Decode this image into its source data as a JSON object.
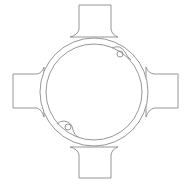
{
  "diagram": {
    "view": "top",
    "colors": {
      "background": "#ffffff",
      "stroke": "#8a8a8a"
    },
    "center": [
      94,
      92
    ],
    "outer_ring_radius": 54,
    "inner_ring_radius": 48,
    "arms": [
      {
        "name": "top",
        "x": 79,
        "y": 5,
        "w": 32,
        "h": 30
      },
      {
        "name": "bottom",
        "x": 79,
        "y": 149,
        "w": 32,
        "h": 29
      },
      {
        "name": "left",
        "x": 13,
        "y": 74,
        "w": 30,
        "h": 34
      },
      {
        "name": "right",
        "x": 150,
        "y": 74,
        "w": 28,
        "h": 34
      }
    ],
    "screw_bosses": [
      {
        "name": "upper-right",
        "cx": 120,
        "cy": 53,
        "r": 3
      },
      {
        "name": "lower-left",
        "cx": 69,
        "cy": 127,
        "r": 3
      }
    ]
  }
}
